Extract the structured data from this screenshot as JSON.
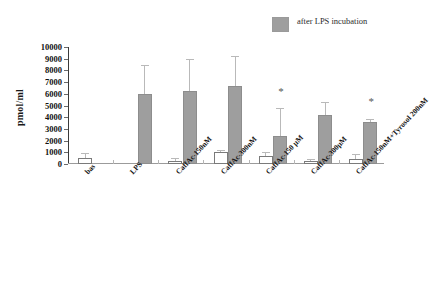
{
  "chart_data": {
    "type": "bar",
    "title": "",
    "subtitle": "",
    "xlabel": "",
    "ylabel": "pmol/ml",
    "ylim": [
      0,
      10000
    ],
    "ytick_values": [
      0,
      1000,
      2000,
      3000,
      4000,
      5000,
      6000,
      7000,
      8000,
      9000,
      10000
    ],
    "ytick_labels": [
      "0",
      "1000",
      "2000",
      "3000",
      "4000",
      "5000",
      "6000",
      "7000",
      "8000",
      "9000",
      "10000"
    ],
    "grid": false,
    "legend_position": "top-right",
    "legend": [
      {
        "label": "after LPS incubation",
        "color": "#9e9e9e"
      }
    ],
    "categories": [
      "bas",
      "LPS",
      "CaffAc-150nM",
      "CaffAc-300nM",
      "CaffAc-150 μM",
      "CaffAc-300μM",
      "CaffAc-150nM+Tyrosol 200nM"
    ],
    "series": [
      {
        "name": "baseline",
        "color": "#ffffff",
        "values": [
          500,
          null,
          300,
          1000,
          700,
          250,
          400
        ],
        "errors": [
          400,
          null,
          250,
          200,
          300,
          200,
          450
        ]
      },
      {
        "name": "after LPS incubation",
        "color": "#9e9e9e",
        "values": [
          null,
          5950,
          6200,
          6700,
          2400,
          4200,
          3600
        ],
        "errors": [
          null,
          2500,
          2800,
          2500,
          2400,
          1100,
          250
        ]
      }
    ],
    "annotations": [
      {
        "text": "*",
        "category": "CaffAc-150 μM",
        "value": 5950
      },
      {
        "text": "*",
        "category": "CaffAc-150nM+Tyrosol 200nM",
        "value": 5100
      }
    ]
  },
  "legend": {
    "label": "after LPS incubation"
  },
  "axes": {
    "y_label": "pmol/ml"
  }
}
